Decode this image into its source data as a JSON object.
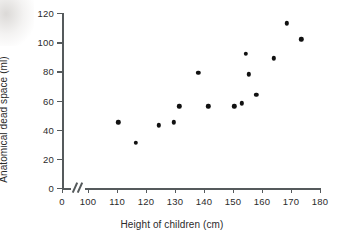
{
  "chart_data": {
    "type": "scatter",
    "title": "",
    "xlabel": "Height of children (cm)",
    "ylabel": "Anatomical dead space (ml)",
    "xlim": [
      100,
      180
    ],
    "ylim": [
      0,
      120
    ],
    "grid": false,
    "legend": false,
    "x_axis_break": true,
    "x_break_symbol": "//",
    "x_origin_tick": "0",
    "xticks": [
      "0",
      "100",
      "110",
      "120",
      "130",
      "140",
      "150",
      "160",
      "170",
      "180"
    ],
    "xtick_values": [
      0,
      100,
      110,
      120,
      130,
      140,
      150,
      160,
      170,
      180
    ],
    "yticks": [
      "0",
      "20",
      "40",
      "60",
      "80",
      "100",
      "120"
    ],
    "ytick_values": [
      0,
      20,
      40,
      60,
      80,
      100,
      120
    ],
    "marker": "filled-circle",
    "marker_color": "#111111",
    "axis_color": "#555a5c",
    "background_color": "#ffffff",
    "n_points": 15,
    "x": [
      110.5,
      116.5,
      124.5,
      129.5,
      131.5,
      138.0,
      141.5,
      150.5,
      153.0,
      154.5,
      155.5,
      158.0,
      164.0,
      168.5,
      173.5
    ],
    "y": [
      45,
      31,
      43,
      45,
      56,
      79,
      56,
      56,
      58,
      92,
      78,
      64,
      89,
      113,
      102
    ],
    "points": [
      {
        "x": 110.5,
        "y": 45
      },
      {
        "x": 116.5,
        "y": 31
      },
      {
        "x": 124.5,
        "y": 43
      },
      {
        "x": 129.5,
        "y": 45
      },
      {
        "x": 131.5,
        "y": 56
      },
      {
        "x": 138.0,
        "y": 79
      },
      {
        "x": 141.5,
        "y": 56
      },
      {
        "x": 150.5,
        "y": 56
      },
      {
        "x": 153.0,
        "y": 58
      },
      {
        "x": 154.5,
        "y": 92
      },
      {
        "x": 155.5,
        "y": 78
      },
      {
        "x": 158.0,
        "y": 64
      },
      {
        "x": 164.0,
        "y": 89
      },
      {
        "x": 168.5,
        "y": 113
      },
      {
        "x": 173.5,
        "y": 102
      }
    ]
  }
}
